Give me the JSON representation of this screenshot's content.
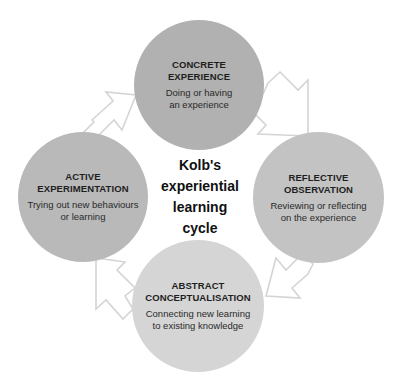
{
  "diagram": {
    "title_lines": [
      "Kolb's",
      "experiential",
      "learning",
      "cycle"
    ],
    "stages": [
      {
        "id": "concrete-experience",
        "title_lines": [
          "CONCRETE",
          "EXPERIENCE"
        ],
        "description_lines": [
          "Doing or having",
          "an experience"
        ],
        "color": "#b1b1b1"
      },
      {
        "id": "reflective-observation",
        "title_lines": [
          "REFLECTIVE",
          "OBSERVATION"
        ],
        "description_lines": [
          "Reviewing or reflecting",
          "on the experience"
        ],
        "color": "#c3c3c3"
      },
      {
        "id": "abstract-conceptualisation",
        "title_lines": [
          "ABSTRACT",
          "CONCEPTUALISATION"
        ],
        "description_lines": [
          "Connecting new learning",
          "to existing knowledge"
        ],
        "color": "#d5d5d5"
      },
      {
        "id": "active-experimentation",
        "title_lines": [
          "ACTIVE",
          "EXPERIMENTATION"
        ],
        "description_lines": [
          "Trying out new behaviours",
          "or learning"
        ],
        "color": "#b9b9b9"
      }
    ],
    "arrow_color": "#d4d4d4",
    "flow": [
      "concrete-experience",
      "reflective-observation",
      "abstract-conceptualisation",
      "active-experimentation",
      "concrete-experience"
    ]
  }
}
